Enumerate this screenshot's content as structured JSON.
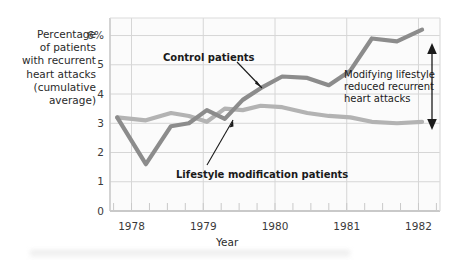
{
  "chart_data": {
    "type": "line",
    "title": "",
    "xlabel": "Year",
    "ylabel": "Percentage of patients with recurrent heart attacks (cumulative average)",
    "ylabel_lines": [
      "Percentage",
      "of patients",
      "with recurrent",
      "heart attacks",
      "(cumulative",
      "average)"
    ],
    "ylim": [
      0,
      6.6
    ],
    "yticks": [
      0,
      1,
      2,
      3,
      4,
      5,
      6
    ],
    "yticklabels": [
      "0",
      "1",
      "2",
      "3",
      "4",
      "5",
      "6%"
    ],
    "xlim": [
      1977.7,
      1982.3
    ],
    "xticks": [
      1978,
      1979,
      1980,
      1981,
      1982
    ],
    "xticklabels": [
      "1978",
      "1979",
      "1980",
      "1981",
      "1982"
    ],
    "grid": "horizontal and vertical, light gray",
    "legend": "inline annotations",
    "series": [
      {
        "name": "Control patients",
        "color": "#8c8c8c",
        "label_text": "Control patients",
        "x": [
          1977.8,
          1978.2,
          1978.55,
          1978.8,
          1979.05,
          1979.3,
          1979.55,
          1979.8,
          1980.1,
          1980.45,
          1980.75,
          1981.05,
          1981.35,
          1981.7,
          1982.05
        ],
        "y": [
          3.2,
          1.6,
          2.9,
          3.0,
          3.45,
          3.15,
          3.8,
          4.2,
          4.6,
          4.55,
          4.3,
          4.8,
          5.9,
          5.8,
          6.2
        ]
      },
      {
        "name": "Lifestyle modification patients",
        "color": "#b3b3b3",
        "label_text": "Lifestyle modification patients",
        "x": [
          1977.8,
          1978.2,
          1978.55,
          1978.8,
          1979.05,
          1979.3,
          1979.55,
          1979.8,
          1980.1,
          1980.45,
          1980.75,
          1981.05,
          1981.35,
          1981.7,
          1982.05
        ],
        "y": [
          3.2,
          3.1,
          3.35,
          3.25,
          3.05,
          3.5,
          3.45,
          3.6,
          3.55,
          3.35,
          3.25,
          3.2,
          3.05,
          3.0,
          3.05
        ]
      }
    ],
    "annotations": [
      {
        "name": "control-patients-label",
        "text": "Control patients",
        "bold": true
      },
      {
        "name": "lifestyle-modification-label",
        "text": "Lifestyle modification patients",
        "bold": true
      },
      {
        "name": "gap-annotation",
        "lines": [
          "Modifying lifestyle",
          "reduced recurrent",
          "heart attacks"
        ],
        "bold": false,
        "arrow": "double-headed vertical"
      }
    ],
    "colors": {
      "control_line": "#8c8c8c",
      "lifestyle_line": "#b3b3b3",
      "grid": "#d6d6d6",
      "axis": "#b8b8b8",
      "text": "#231f20",
      "background": "#ffffff"
    }
  },
  "axes": {
    "x_title": "Year",
    "y_tick_6": "6%",
    "y_tick_5": "5",
    "y_tick_4": "4",
    "y_tick_3": "3",
    "y_tick_2": "2",
    "y_tick_1": "1",
    "y_tick_0": "0",
    "x_tick_1978": "1978",
    "x_tick_1979": "1979",
    "x_tick_1980": "1980",
    "x_tick_1981": "1981",
    "x_tick_1982": "1982"
  },
  "ytitle": {
    "l1": "Percentage",
    "l2": "of patients",
    "l3": "with recurrent",
    "l4": "heart attacks",
    "l5": "(cumulative",
    "l6": "average)"
  },
  "labels": {
    "control": "Control patients",
    "lifestyle": "Lifestyle modification patients",
    "gap1": "Modifying lifestyle",
    "gap2": "reduced recurrent",
    "gap3": "heart attacks"
  }
}
